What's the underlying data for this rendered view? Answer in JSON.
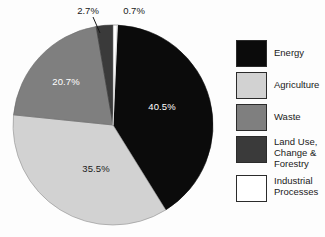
{
  "chart_data": {
    "type": "pie",
    "title": "",
    "subtitle": "",
    "xlabel": "",
    "ylabel": "",
    "legend_position": "right",
    "grid": false,
    "units": "percent",
    "start_angle_deg": 2.5,
    "direction": "clockwise",
    "categories": [
      "Energy",
      "Agriculture",
      "Waste",
      "Land Use, Change & Forestry",
      "Industrial Processes"
    ],
    "values": [
      40.5,
      35.5,
      20.7,
      2.7,
      0.7
    ],
    "labels": [
      "40.5%",
      "35.5%",
      "20.7%",
      "2.7%",
      "0.7%"
    ],
    "colors": [
      "#0b0b0b",
      "#d2d2d2",
      "#7f7f7f",
      "#3a3a3a",
      "#ffffff"
    ],
    "label_colors": [
      "#ffffff",
      "#1a1a1a",
      "#ffffff",
      "#1a1a1a",
      "#1a1a1a"
    ],
    "slices": [
      {
        "name": "Energy",
        "value": 40.5,
        "label": "40.5%",
        "color": "#0b0b0b",
        "label_color": "#ffffff",
        "label_placement": "inside"
      },
      {
        "name": "Agriculture",
        "value": 35.5,
        "label": "35.5%",
        "color": "#d2d2d2",
        "label_color": "#1a1a1a",
        "label_placement": "inside"
      },
      {
        "name": "Waste",
        "value": 20.7,
        "label": "20.7%",
        "color": "#7f7f7f",
        "label_color": "#ffffff",
        "label_placement": "inside"
      },
      {
        "name": "Land Use, Change & Forestry",
        "value": 2.7,
        "label": "2.7%",
        "color": "#3a3a3a",
        "label_color": "#1a1a1a",
        "label_placement": "callout"
      },
      {
        "name": "Industrial Processes",
        "value": 0.7,
        "label": "0.7%",
        "color": "#ffffff",
        "label_color": "#1a1a1a",
        "label_placement": "callout"
      }
    ]
  },
  "pie": {
    "label_energy": "40.5%",
    "label_agriculture": "35.5%",
    "label_waste": "20.7%",
    "label_land_use": "2.7%",
    "label_industrial": "0.7%"
  },
  "legend": {
    "items": [
      {
        "label": "Energy",
        "color": "#0b0b0b"
      },
      {
        "label": "Agriculture",
        "color": "#d2d2d2"
      },
      {
        "label": "Waste",
        "color": "#7f7f7f"
      },
      {
        "label": "Land Use,\nChange &\nForestry",
        "color": "#3a3a3a"
      },
      {
        "label": "Industrial\nProcesses",
        "color": "#ffffff"
      }
    ]
  }
}
